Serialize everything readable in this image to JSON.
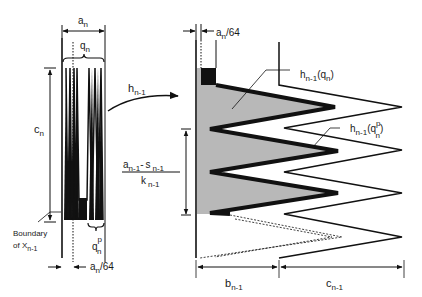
{
  "colors": {
    "ink": "#111111",
    "fill_gray": "#b8b8b8",
    "background": "#ffffff"
  },
  "left_figure": {
    "width_label_main": "a",
    "width_label_sub": "n",
    "brace_label_main": "q",
    "brace_label_sub": "n",
    "height_label_main": "c",
    "height_label_sub": "n",
    "boundary_label_line1": "Boundary",
    "boundary_label_line2_main": "of X",
    "boundary_label_line2_sub": "n-1",
    "qp_label_main": "q",
    "qp_label_sup": "p",
    "qp_label_sub": "n",
    "gap_label_main": "a",
    "gap_label_sub": "n",
    "gap_label_tail": "/64"
  },
  "map_arrow": {
    "label_main": "h",
    "label_sub": "n-1"
  },
  "middle_fraction": {
    "numerator_a": "a",
    "numerator_a_sub": "n-1",
    "numerator_minus": "-",
    "numerator_s": "s",
    "numerator_s_sub": "n-1",
    "denominator_k": "k",
    "denominator_k_sub": "n-1"
  },
  "right_figure": {
    "gap_label_main": "a",
    "gap_label_sub": "n",
    "gap_label_tail": "/64",
    "image_qn_main": "h",
    "image_qn_sub": "n-1",
    "image_qn_arg": "(q",
    "image_qn_arg_sub": "n",
    "image_qn_close": ")",
    "image_qp_main": "h",
    "image_qp_sub": "n-1",
    "image_qp_arg": "(q",
    "image_qp_arg_sup": "p",
    "image_qp_arg_sub": "n",
    "image_qp_close": ")",
    "b_label_main": "b",
    "b_label_sub": "n-1",
    "c_label_main": "c",
    "c_label_sub": "n-1"
  }
}
